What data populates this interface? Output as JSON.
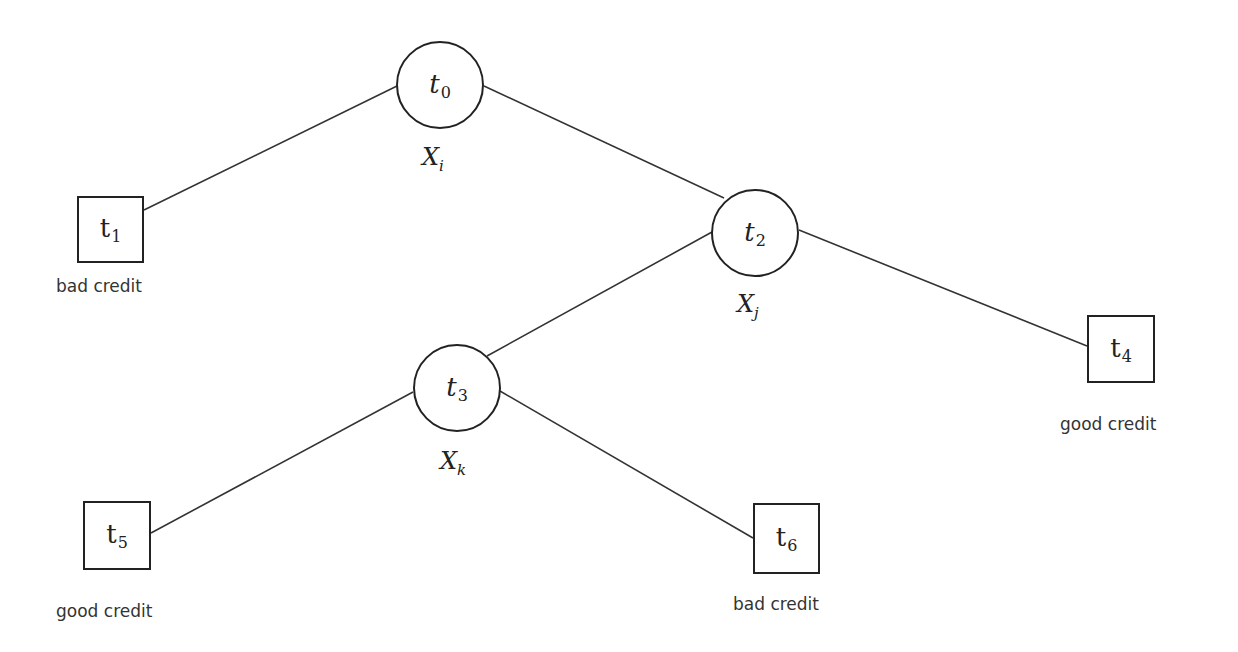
{
  "diagram": {
    "type": "decision-tree",
    "nodes": [
      {
        "id": "t0",
        "shape": "circle",
        "symbol": "t",
        "index": "0",
        "split_var": "X",
        "split_index": "i",
        "cx": 440,
        "cy": 85,
        "r": 44
      },
      {
        "id": "t1",
        "shape": "square",
        "symbol": "t",
        "index": "1",
        "caption": "bad credit",
        "x": 77,
        "y": 196,
        "w": 67,
        "h": 67
      },
      {
        "id": "t2",
        "shape": "circle",
        "symbol": "t",
        "index": "2",
        "split_var": "X",
        "split_index": "j",
        "cx": 755,
        "cy": 233,
        "r": 44
      },
      {
        "id": "t3",
        "shape": "circle",
        "symbol": "t",
        "index": "3",
        "split_var": "X",
        "split_index": "k",
        "cx": 457,
        "cy": 388,
        "r": 44
      },
      {
        "id": "t4",
        "shape": "square",
        "symbol": "t",
        "index": "4",
        "caption": "good credit",
        "x": 1087,
        "y": 315,
        "w": 68,
        "h": 68
      },
      {
        "id": "t5",
        "shape": "square",
        "symbol": "t",
        "index": "5",
        "caption": "good credit",
        "x": 83,
        "y": 501,
        "w": 68,
        "h": 69
      },
      {
        "id": "t6",
        "shape": "square",
        "symbol": "t",
        "index": "6",
        "caption": "bad credit",
        "x": 753,
        "y": 503,
        "w": 67,
        "h": 71
      }
    ],
    "edges": [
      {
        "from": "t0",
        "to": "t1",
        "x1": 397,
        "y1": 86,
        "x2": 144,
        "y2": 210
      },
      {
        "from": "t0",
        "to": "t2",
        "x1": 484,
        "y1": 86,
        "x2": 724,
        "y2": 198
      },
      {
        "from": "t2",
        "to": "t4",
        "x1": 799,
        "y1": 230,
        "x2": 1087,
        "y2": 346
      },
      {
        "from": "t2",
        "to": "t3",
        "x1": 712,
        "y1": 232,
        "x2": 487,
        "y2": 356
      },
      {
        "from": "t3",
        "to": "t5",
        "x1": 413,
        "y1": 392,
        "x2": 151,
        "y2": 533
      },
      {
        "from": "t3",
        "to": "t6",
        "x1": 500,
        "y1": 391,
        "x2": 753,
        "y2": 538
      }
    ]
  },
  "labels": {
    "t0": {
      "sym": "t",
      "sub": "0"
    },
    "t1": {
      "sym": "t",
      "sub": "1"
    },
    "t2": {
      "sym": "t",
      "sub": "2"
    },
    "t3": {
      "sym": "t",
      "sub": "3"
    },
    "t4": {
      "sym": "t",
      "sub": "4"
    },
    "t5": {
      "sym": "t",
      "sub": "5"
    },
    "t6": {
      "sym": "t",
      "sub": "6"
    },
    "xi": {
      "sym": "X",
      "sub": "i"
    },
    "xj": {
      "sym": "X",
      "sub": "j"
    },
    "xk": {
      "sym": "X",
      "sub": "k"
    },
    "cap_t1": "bad credit",
    "cap_t4": "good credit",
    "cap_t5": "good credit",
    "cap_t6": "bad credit"
  },
  "colors": {
    "stroke": "#222222",
    "background": "#ffffff",
    "text": "#333333"
  }
}
